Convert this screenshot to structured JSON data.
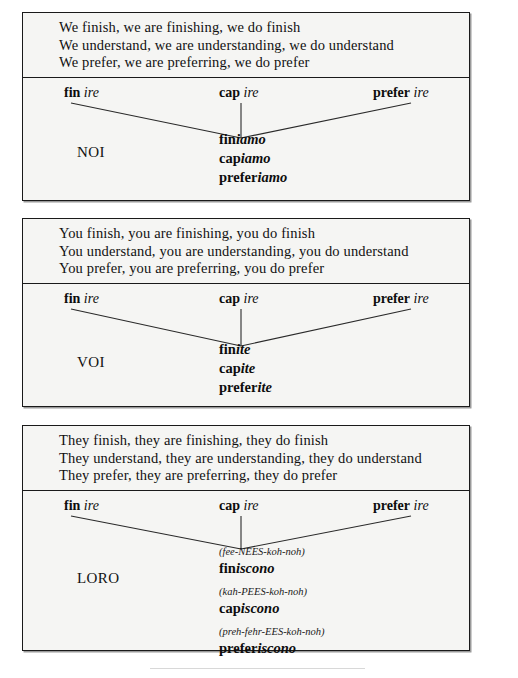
{
  "page": {
    "background": "#ffffff",
    "box_fill": "#f5f5f3",
    "border_color": "#1a1a1a"
  },
  "boxes": [
    {
      "id": "noi",
      "pronoun": "NOI",
      "english": [
        "We finish, we are finishing, we do finish",
        "We understand, we are understanding, we do understand",
        "We prefer, we are preferring, we do prefer"
      ],
      "stems": [
        {
          "root": "fin",
          "ending": "ire"
        },
        {
          "root": "cap",
          "ending": "ire"
        },
        {
          "root": "prefer",
          "ending": "ire"
        }
      ],
      "forms": [
        {
          "phonetic": "",
          "root": "fin",
          "suffix": "iamo"
        },
        {
          "phonetic": "",
          "root": "cap",
          "suffix": "iamo"
        },
        {
          "phonetic": "",
          "root": "prefer",
          "suffix": "iamo"
        }
      ]
    },
    {
      "id": "voi",
      "pronoun": "VOI",
      "english": [
        "You finish, you are finishing, you do finish",
        "You understand, you are understanding, you do understand",
        "You prefer, you are preferring, you do prefer"
      ],
      "stems": [
        {
          "root": "fin",
          "ending": "ire"
        },
        {
          "root": "cap",
          "ending": "ire"
        },
        {
          "root": "prefer",
          "ending": "ire"
        }
      ],
      "forms": [
        {
          "phonetic": "",
          "root": "fin",
          "suffix": "ite"
        },
        {
          "phonetic": "",
          "root": "cap",
          "suffix": "ite"
        },
        {
          "phonetic": "",
          "root": "prefer",
          "suffix": "ite"
        }
      ]
    },
    {
      "id": "loro",
      "pronoun": "LORO",
      "english": [
        "They finish, they are finishing, they do finish",
        "They understand, they are understanding, they do understand",
        "They prefer, they are preferring, they do prefer"
      ],
      "stems": [
        {
          "root": "fin",
          "ending": "ire"
        },
        {
          "root": "cap",
          "ending": "ire"
        },
        {
          "root": "prefer",
          "ending": "ire"
        }
      ],
      "forms": [
        {
          "phonetic": "(fee-NEES-koh-noh)",
          "root": "fin",
          "suffix": "iscono"
        },
        {
          "phonetic": "(kah-PEES-koh-noh)",
          "root": "cap",
          "suffix": "iscono"
        },
        {
          "phonetic": "(preh-fehr-EES-koh-noh)",
          "root": "prefer",
          "suffix": "iscono"
        }
      ]
    }
  ]
}
